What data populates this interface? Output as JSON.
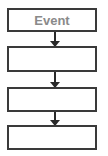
{
  "flowchart": {
    "steps": [
      {
        "label": "Event"
      },
      {
        "label": ""
      },
      {
        "label": ""
      },
      {
        "label": ""
      }
    ],
    "colors": {
      "border": "#3a3a3a",
      "text": "#8a8a8a",
      "arrow": "#2a2a2a"
    }
  }
}
